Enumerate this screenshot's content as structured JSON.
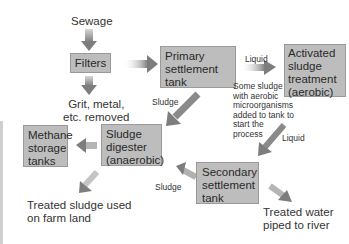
{
  "diagram": {
    "colors": {
      "box_fill": "#bdbdbd",
      "box_border": "#9a9a9a",
      "arrow": "#8a8a8a",
      "text": "#333333"
    },
    "nodes": {
      "sewage": "Sewage",
      "filters": "Filters",
      "grit": [
        "Grit, metal,",
        "etc. removed"
      ],
      "primary": [
        "Primary",
        "settlement",
        "tank"
      ],
      "activated": [
        "Activated",
        "sludge",
        "treatment",
        "(aerobic)"
      ],
      "digester": [
        "Sludge",
        "digester",
        "(anaerobic)"
      ],
      "methane": [
        "Methane",
        "storage",
        "tanks"
      ],
      "secondary": [
        "Secondary",
        "settlement",
        "tank"
      ],
      "treated_sludge": [
        "Treated sludge used",
        "on farm land"
      ],
      "treated_water": [
        "Treated water",
        "piped to river"
      ]
    },
    "edge_labels": {
      "primary_to_activated": "Liquid",
      "primary_to_digester": "Sludge",
      "activated_to_secondary": "Liquid",
      "secondary_to_digester": "Sludge"
    },
    "note": [
      "Some sludge",
      "with aerobic",
      "microorganisms",
      "added to tank to",
      "start the",
      "process"
    ]
  }
}
